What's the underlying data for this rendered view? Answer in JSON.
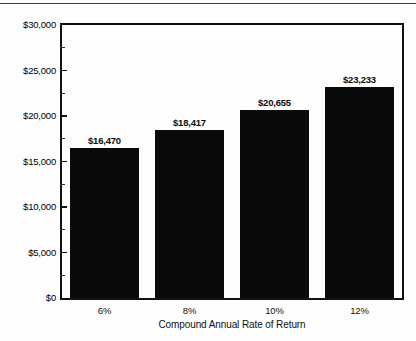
{
  "chart_data": {
    "type": "bar",
    "title": "",
    "xlabel": "Compound Annual Rate of Return",
    "ylabel": "",
    "categories": [
      "6%",
      "8%",
      "10%",
      "12%"
    ],
    "values": [
      16470,
      18417,
      20655,
      23233
    ],
    "value_labels": [
      "$16,470",
      "$18,417",
      "$20,655",
      "$23,233"
    ],
    "ylim": [
      0,
      30000
    ],
    "ytick_values": [
      0,
      5000,
      10000,
      15000,
      20000,
      25000,
      30000
    ],
    "ytick_labels": [
      "$0",
      "$5,000",
      "$10,000",
      "$15,000",
      "$20,000",
      "$25,000",
      "$30,000"
    ],
    "yminor_values": [
      2500,
      7500,
      12500,
      17500,
      22500,
      27500
    ],
    "grid": false,
    "legend": null,
    "bar_color": "#0a0a0a",
    "axis_color": "#111111",
    "background_color": "#fdfdfd"
  }
}
